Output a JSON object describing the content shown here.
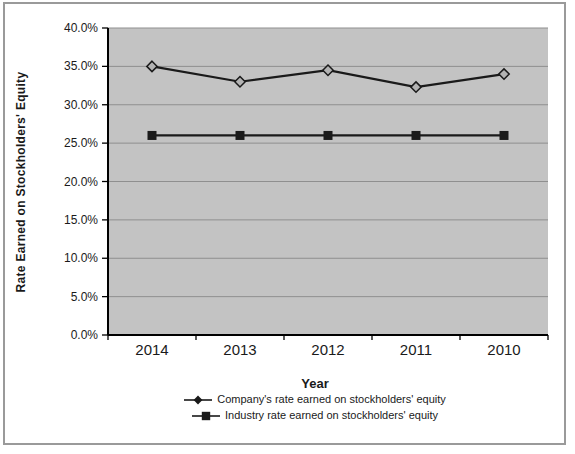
{
  "chart_data": {
    "type": "line",
    "title": "",
    "xlabel": "Year",
    "ylabel": "Rate Earned on Stockholders' Equity",
    "categories": [
      "2014",
      "2013",
      "2012",
      "2011",
      "2010"
    ],
    "series": [
      {
        "name": "Company's rate earned on stockholders' equity",
        "marker": "diamond",
        "values": [
          35.0,
          33.0,
          34.5,
          32.3,
          34.0
        ]
      },
      {
        "name": "Industry rate earned on stockholders' equity",
        "marker": "square",
        "values": [
          26.0,
          26.0,
          26.0,
          26.0,
          26.0
        ]
      }
    ],
    "ylim": [
      0,
      40
    ],
    "ytick_step": 5,
    "ytick_values": [
      40,
      35,
      30,
      25,
      20,
      15,
      10,
      5,
      0
    ],
    "ytick_labels": [
      "40.0%",
      "35.0%",
      "30.0%",
      "25.0%",
      "20.0%",
      "15.0%",
      "10.0%",
      "5.0%",
      "0.0%"
    ],
    "grid": true,
    "legend_position": "bottom",
    "colors": {
      "plot_bg": "#c3c3c3",
      "grid": "#8f8f8f",
      "line": "#1a1a1a",
      "marker_fill": "#b3b3b3",
      "frame_border": "#9a9a9a",
      "text": "#1a1a1a"
    }
  }
}
